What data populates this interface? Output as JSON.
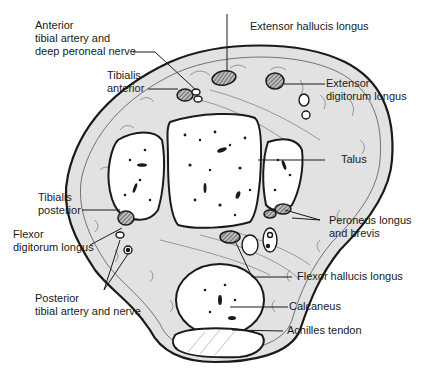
{
  "diagram": {
    "colors": {
      "outline": "#1a1a1a",
      "tissue_fill": "#e2e2e2",
      "bone_fill": "#ffffff",
      "tendon_fill": "#8a8a8a",
      "background": "#ffffff"
    },
    "labels": {
      "anterior_tibial": {
        "line1": "Anterior",
        "line2": "tibial artery and",
        "line3": "deep peroneal nerve"
      },
      "extensor_hallucis": {
        "line1": "Extensor hallucis longus"
      },
      "tibialis_anterior": {
        "line1": "Tibialis",
        "line2": "anterior"
      },
      "extensor_digitorum": {
        "line1": "Extensor",
        "line2": "digitorum longus"
      },
      "talus": {
        "line1": "Talus"
      },
      "tibialis_posterior": {
        "line1": "Tibialis",
        "line2": "posterior"
      },
      "flexor_digitorum": {
        "line1": "Flexor",
        "line2": "digitorum longus"
      },
      "peroneus": {
        "line1": "Peroneus longus",
        "line2": "and brevis"
      },
      "flexor_hallucis": {
        "line1": "Flexor hallucis longus"
      },
      "posterior_tibial": {
        "line1": "Posterior",
        "line2": "tibial artery and nerve"
      },
      "calcaneus": {
        "line1": "Calcaneus"
      },
      "achilles": {
        "line1": "Achilles tendon"
      }
    }
  }
}
